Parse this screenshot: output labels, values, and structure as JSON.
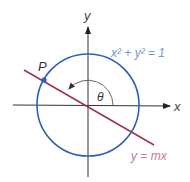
{
  "diagram": {
    "axes": {
      "x_label": "x",
      "y_label": "y",
      "color": "#333333"
    },
    "circle": {
      "equation": "x² + y² = 1",
      "color": "#2f5fb3",
      "label_color": "#7a95c8"
    },
    "line": {
      "equation": "y = mx",
      "color": "#a0344a",
      "label_color": "#c07a88"
    },
    "point": {
      "label": "P",
      "color": "#2f5fb3"
    },
    "angle": {
      "label": "θ",
      "arc_color": "#555555"
    }
  }
}
